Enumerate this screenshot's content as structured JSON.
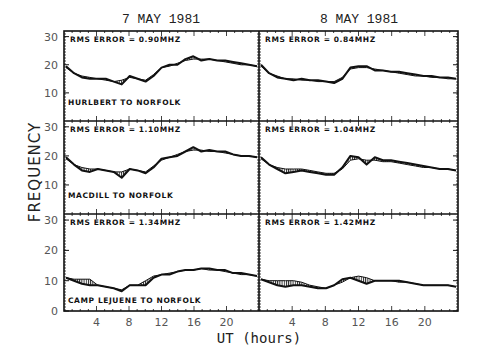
{
  "figure": {
    "column_titles": [
      "7 MAY 1981",
      "8 MAY 1981"
    ],
    "ylabel": "FREQUENCY",
    "xlabel": "UT (hours)",
    "y_ticks": [
      0,
      10,
      20,
      30
    ],
    "x_ticks": [
      4,
      8,
      12,
      16,
      20
    ],
    "rows": [
      {
        "path_label": "HURLBERT TO NORFOLK",
        "rms": [
          "RMS ERROR = 0.90MHZ",
          "RMS ERROR = 0.84MHZ"
        ]
      },
      {
        "path_label": "MACDILL TO NORFOLK",
        "rms": [
          "RMS ERROR = 1.10MHZ",
          "RMS ERROR = 1.04MHZ"
        ]
      },
      {
        "path_label": "CAMP LEJUENE TO NORFOLK",
        "rms": [
          "RMS ERROR = 1.34MHZ",
          "RMS ERROR = 1.42MHZ"
        ]
      }
    ]
  },
  "chart_data": {
    "type": "line",
    "title": "",
    "xlabel": "UT (hours)",
    "ylabel": "FREQUENCY",
    "xlim": [
      0,
      24
    ],
    "ylim": [
      0,
      32
    ],
    "grid": false,
    "layout": "3 rows x 2 columns small multiples; hatched area between observed and predicted curves",
    "column_titles": [
      "7 MAY 1981",
      "8 MAY 1981"
    ],
    "x_tick_labels": [
      "4",
      "8",
      "12",
      "16",
      "20"
    ],
    "y_tick_labels": [
      "0",
      "10",
      "20",
      "30"
    ],
    "panels": [
      {
        "row": 0,
        "col": 0,
        "path": "HURLBERT TO NORFOLK",
        "date": "7 MAY 1981",
        "annotation": "RMS ERROR = 0.90MHZ",
        "x": [
          0,
          1,
          2,
          3,
          4,
          5,
          6,
          7,
          8,
          9,
          10,
          11,
          12,
          13,
          14,
          15,
          16,
          17,
          18,
          19,
          20,
          21,
          22,
          23,
          24
        ],
        "observed": [
          19.5,
          17,
          15.5,
          15,
          15,
          15,
          14,
          13,
          16,
          15,
          14,
          16,
          19,
          20,
          20,
          22,
          23,
          21.5,
          22,
          21.5,
          21.5,
          21,
          20.5,
          20,
          19.5
        ],
        "predicted": [
          19,
          17,
          16,
          15.5,
          15,
          14.5,
          14,
          14.5,
          15.5,
          15,
          14.5,
          16.5,
          19,
          19.5,
          20.5,
          21.5,
          22,
          22,
          22,
          21.5,
          21,
          20.5,
          20,
          20,
          19.5
        ]
      },
      {
        "row": 0,
        "col": 1,
        "path": "HURLBERT TO NORFOLK",
        "date": "8 MAY 1981",
        "annotation": "RMS ERROR = 0.84MHZ",
        "x": [
          0,
          1,
          2,
          3,
          4,
          5,
          6,
          7,
          8,
          9,
          10,
          11,
          12,
          13,
          14,
          15,
          16,
          17,
          18,
          19,
          20,
          21,
          22,
          23,
          24
        ],
        "observed": [
          20,
          17,
          15.5,
          15,
          14.5,
          15,
          14.5,
          14.5,
          14,
          13.5,
          15,
          19,
          19.5,
          19.5,
          18,
          18,
          17.5,
          17.5,
          17,
          16.5,
          16,
          16,
          15.5,
          15.5,
          15
        ],
        "predicted": [
          19.5,
          17,
          16,
          15,
          15,
          14.5,
          14.5,
          14,
          14,
          14,
          15.5,
          18.5,
          19,
          19,
          18.5,
          18,
          17.5,
          17,
          16.5,
          16,
          16,
          15.5,
          15.5,
          15,
          15
        ]
      },
      {
        "row": 1,
        "col": 0,
        "path": "MACDILL TO NORFOLK",
        "date": "7 MAY 1981",
        "annotation": "RMS ERROR = 1.10MHZ",
        "x": [
          0,
          1,
          2,
          3,
          4,
          5,
          6,
          7,
          8,
          9,
          10,
          11,
          12,
          13,
          14,
          15,
          16,
          17,
          18,
          19,
          20,
          21,
          22,
          23,
          24
        ],
        "observed": [
          19.5,
          17,
          15,
          14.5,
          15.5,
          15,
          14.5,
          12.5,
          15.5,
          15,
          14,
          16,
          19,
          19.5,
          20,
          21.5,
          23,
          21.5,
          22,
          21.5,
          21.5,
          20.5,
          20,
          20,
          19.5
        ],
        "predicted": [
          19,
          17,
          16,
          15.5,
          15.5,
          15,
          14.5,
          14.5,
          15.5,
          15,
          14.5,
          16.5,
          18.5,
          19.5,
          20.5,
          21.5,
          22,
          22,
          21.5,
          21.5,
          21,
          20.5,
          20,
          20,
          19.5
        ]
      },
      {
        "row": 1,
        "col": 1,
        "path": "MACDILL TO NORFOLK",
        "date": "8 MAY 1981",
        "annotation": "RMS ERROR = 1.04MHZ",
        "x": [
          0,
          1,
          2,
          3,
          4,
          5,
          6,
          7,
          8,
          9,
          10,
          11,
          12,
          13,
          14,
          15,
          16,
          17,
          18,
          19,
          20,
          21,
          22,
          23,
          24
        ],
        "observed": [
          19.5,
          17,
          15.5,
          14,
          14.5,
          15,
          14.5,
          14,
          13.5,
          13.5,
          16,
          20,
          19.5,
          17,
          19.5,
          18.5,
          18.5,
          18,
          17.5,
          17,
          16.5,
          16,
          15.5,
          15.5,
          15
        ],
        "predicted": [
          19,
          17,
          16,
          15.5,
          15.5,
          15.5,
          15,
          14.5,
          14,
          14,
          15.5,
          18.5,
          19,
          18.5,
          18.5,
          18,
          18,
          17.5,
          17,
          16.5,
          16,
          16,
          15.5,
          15.5,
          15
        ]
      },
      {
        "row": 2,
        "col": 0,
        "path": "CAMP LEJUENE TO NORFOLK",
        "date": "7 MAY 1981",
        "annotation": "RMS ERROR = 1.34MHZ",
        "x": [
          0,
          1,
          2,
          3,
          4,
          5,
          6,
          7,
          8,
          9,
          10,
          11,
          12,
          13,
          14,
          15,
          16,
          17,
          18,
          19,
          20,
          21,
          22,
          23,
          24
        ],
        "observed": [
          11,
          10,
          9,
          8.5,
          8.5,
          8,
          7.5,
          6.5,
          8.5,
          8.5,
          8.5,
          11,
          12,
          12,
          13,
          13.5,
          13.5,
          14,
          14,
          13.5,
          13.5,
          12.5,
          12.5,
          12,
          11.5
        ],
        "predicted": [
          11,
          10.5,
          10.5,
          10.5,
          8.5,
          8,
          7.5,
          7,
          8.5,
          8.5,
          10,
          11.5,
          12,
          12.5,
          13,
          13.5,
          13.5,
          14,
          13.5,
          13.5,
          13,
          12.5,
          12,
          12,
          11.5
        ]
      },
      {
        "row": 2,
        "col": 1,
        "path": "CAMP LEJUENE TO NORFOLK",
        "date": "8 MAY 1981",
        "annotation": "RMS ERROR = 1.42MHZ",
        "x": [
          0,
          1,
          2,
          3,
          4,
          5,
          6,
          7,
          8,
          9,
          10,
          11,
          12,
          13,
          14,
          15,
          16,
          17,
          18,
          19,
          20,
          21,
          22,
          23,
          24
        ],
        "observed": [
          10.5,
          9.5,
          8.5,
          8,
          8.5,
          8.5,
          8,
          7.5,
          7.5,
          8.5,
          10.5,
          11,
          10,
          9,
          10,
          10,
          10,
          10,
          9.5,
          9,
          8.5,
          8.5,
          8.5,
          8.5,
          8
        ],
        "predicted": [
          10.5,
          10,
          10,
          10,
          10,
          9.5,
          8.5,
          8,
          7.5,
          8.5,
          9.5,
          11,
          11.5,
          11,
          10,
          10,
          10,
          9.5,
          9.5,
          9,
          8.5,
          8.5,
          8.5,
          8.5,
          8
        ]
      }
    ]
  }
}
